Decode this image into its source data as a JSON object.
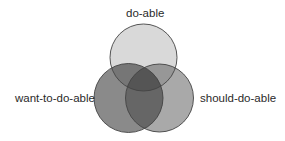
{
  "diagram": {
    "type": "venn",
    "sets": [
      {
        "id": "top",
        "label": "do-able",
        "fill": "#d9d9d9"
      },
      {
        "id": "left",
        "label": "want-to-do-able",
        "fill": "#8a8a8a"
      },
      {
        "id": "right",
        "label": "should-do-able",
        "fill": "#a9a9a9"
      }
    ],
    "overlap_colors": {
      "top_left": "#767676",
      "top_right": "#979797",
      "left_right": "#666666",
      "all": "#555555"
    },
    "stroke": "#444444"
  }
}
